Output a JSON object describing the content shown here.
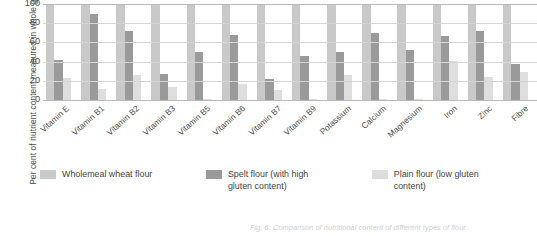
{
  "chart_data": {
    "type": "bar",
    "title": "",
    "xlabel": "",
    "ylabel": "Per cent of nutrient content measured in whole grains",
    "ylim": [
      0,
      100
    ],
    "yticks": [
      100,
      80,
      60,
      40,
      20,
      0
    ],
    "grid": true,
    "legend_position": "bottom",
    "categories": [
      "Vitamin E",
      "Vitamin B1",
      "Vitamin B2",
      "Vitamin B3",
      "Vitamin B5",
      "Vitamin B6",
      "Vitamin B7",
      "Vitamin B9",
      "Potassium",
      "Calcium",
      "Magnesium",
      "Iron",
      "Zinc",
      "Fibre"
    ],
    "series": [
      {
        "name": "Wholemeal wheat flour",
        "color": "#c9c9c9",
        "values": [
          100,
          100,
          100,
          100,
          100,
          100,
          100,
          100,
          100,
          100,
          100,
          100,
          100,
          100
        ]
      },
      {
        "name": "Spelt flour (with high gluten content)",
        "color": "#9a9a9a",
        "values": [
          42,
          90,
          72,
          27,
          50,
          68,
          22,
          46,
          50,
          70,
          52,
          67,
          72,
          37
        ]
      },
      {
        "name": "Plain flour (low gluten content)",
        "color": "#dedede",
        "values": [
          23,
          11,
          26,
          14,
          1,
          17,
          10,
          1,
          26,
          1,
          1,
          41,
          24,
          29
        ]
      }
    ]
  },
  "legend": {
    "items": [
      {
        "label": "Wholemeal wheat flour"
      },
      {
        "label": "Spelt flour (with high gluten content)"
      },
      {
        "label": "Plain flour (low gluten content)"
      }
    ]
  },
  "caption": "Fig. 6: Comparison of nutritional content of different types of flour"
}
